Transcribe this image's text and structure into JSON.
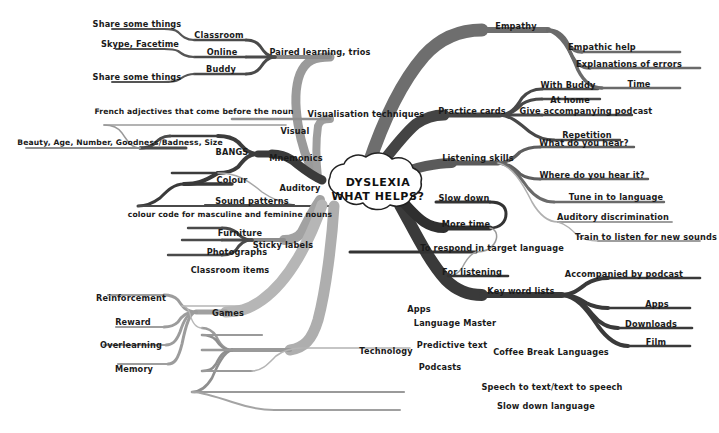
{
  "diagram": {
    "type": "mind-map",
    "title": "DYSLEXIA WHAT HELPS?",
    "center": {
      "line1": "DYSLEXIA",
      "line2": "WHAT HELPS?"
    },
    "palette": {
      "background": "#ffffff",
      "text": "#1a1a1a",
      "branch_dark": "#3a3a3a",
      "branch_mid": "#6e6e6e",
      "branch_light": "#a8a8a8",
      "branch_pale": "#c4c4c4"
    },
    "branches": [
      {
        "id": "paired-learning",
        "label": "Paired learning, trios",
        "children": [
          {
            "label": "Classroom",
            "children": [
              {
                "label": "Share some things"
              }
            ]
          },
          {
            "label": "Online",
            "children": [
              {
                "label": "Skype, Facetime"
              }
            ]
          },
          {
            "label": "Buddy",
            "children": [
              {
                "label": "Share some things"
              }
            ]
          }
        ]
      },
      {
        "id": "visualisation",
        "label": "Visualisation techniques",
        "children": []
      },
      {
        "id": "mnemonics",
        "label": "Mnemonics",
        "children": [
          {
            "label": "Visual",
            "children": [
              {
                "label": "BANGS",
                "children": [
                  {
                    "label": "French adjectives that come before the noun"
                  },
                  {
                    "label": "Beauty, Age, Number, Goodness/Badness, Size"
                  }
                ]
              }
            ]
          },
          {
            "label": "Auditory",
            "children": [
              {
                "label": "Colour",
                "children": [
                  {
                    "label": "colour code for masculine and feminine nouns"
                  }
                ]
              },
              {
                "label": "Sound patterns"
              }
            ]
          }
        ]
      },
      {
        "id": "sticky-labels",
        "label": "Sticky labels",
        "children": [
          {
            "label": "Furniture"
          },
          {
            "label": "Photographs"
          },
          {
            "label": "Classroom items"
          }
        ]
      },
      {
        "id": "games",
        "label": "Games",
        "children": [
          {
            "label": "Reinforcement"
          },
          {
            "label": "Reward"
          },
          {
            "label": "Overlearning"
          },
          {
            "label": "Memory"
          }
        ]
      },
      {
        "id": "technology",
        "label": "Technology",
        "children": [
          {
            "label": "Apps"
          },
          {
            "label": "Language Master"
          },
          {
            "label": "Predictive text"
          },
          {
            "label": "Podcasts",
            "children": [
              {
                "label": "Coffee Break Languages"
              }
            ]
          },
          {
            "label": "Speech to text/text to speech"
          },
          {
            "label": "Slow down language"
          }
        ]
      },
      {
        "id": "key-word-lists",
        "label": "Key word lists",
        "children": [
          {
            "label": "Accompanied by podcast"
          },
          {
            "label": "Apps"
          },
          {
            "label": "Downloads"
          },
          {
            "label": "Film"
          }
        ]
      },
      {
        "id": "more-time",
        "label": "More time",
        "children": [
          {
            "label": "Slow down"
          },
          {
            "label": "To respond in target language"
          },
          {
            "label": "For listening"
          }
        ]
      },
      {
        "id": "listening-skills",
        "label": "Listening skills",
        "children": [
          {
            "label": "What do you hear?"
          },
          {
            "label": "Where do you hear it?"
          },
          {
            "label": "Tune in to language"
          },
          {
            "label": "Auditory discrimination",
            "children": [
              {
                "label": "Train to listen for new sounds"
              }
            ]
          }
        ]
      },
      {
        "id": "practice-cards",
        "label": "Practice cards",
        "children": [
          {
            "label": "With Buddy"
          },
          {
            "label": "At home"
          },
          {
            "label": "Give accompanying podcast"
          },
          {
            "label": "Repetition"
          }
        ]
      },
      {
        "id": "empathy",
        "label": "Empathy",
        "children": [
          {
            "label": "Empathic help"
          },
          {
            "label": "Explanations of errors"
          },
          {
            "label": "Time"
          }
        ]
      }
    ],
    "labels": {
      "share_some_things_1": "Share some things",
      "skype_facetime": "Skype, Facetime",
      "share_some_things_2": "Share some things",
      "classroom": "Classroom",
      "online": "Online",
      "buddy": "Buddy",
      "paired_learning": "Paired learning, trios",
      "french_adjectives": "French adjectives that come before the noun",
      "bangs_expansion": "Beauty, Age, Number, Goodness/Badness, Size",
      "bangs": "BANGS",
      "visual": "Visual",
      "mnemonics": "Mnemonics",
      "auditory": "Auditory",
      "colour": "Colour",
      "sound_patterns": "Sound patterns",
      "colour_code": "colour code for masculine and feminine nouns",
      "visualisation": "Visualisation techniques",
      "furniture": "Furniture",
      "photographs": "Photographs",
      "classroom_items": "Classroom items",
      "sticky_labels": "Sticky labels",
      "reinforcement": "Reinforcement",
      "reward": "Reward",
      "overlearning": "Overlearning",
      "memory": "Memory",
      "games": "Games",
      "technology": "Technology",
      "apps_tech": "Apps",
      "language_master": "Language Master",
      "predictive_text": "Predictive text",
      "podcasts": "Podcasts",
      "coffee_break": "Coffee Break Languages",
      "speech_to_text": "Speech to text/text to speech",
      "slow_down_language": "Slow down language",
      "empathy": "Empathy",
      "empathic_help": "Empathic help",
      "explanations_errors": "Explanations of errors",
      "time": "Time",
      "practice_cards": "Practice cards",
      "with_buddy": "With Buddy",
      "at_home": "At home",
      "give_podcast": "Give accompanying podcast",
      "repetition": "Repetition",
      "listening_skills": "Listening skills",
      "what_do_you_hear": "What do you hear?",
      "where_do_you_hear": "Where do you hear it?",
      "tune_in": "Tune in to language",
      "auditory_discrimination": "Auditory discrimination",
      "train_to_listen": "Train to listen for new sounds",
      "slow_down": "Slow down",
      "more_time": "More time",
      "to_respond": "To respond in target language",
      "for_listening": "For listening",
      "key_word_lists": "Key word lists",
      "accompanied_podcast": "Accompanied by podcast",
      "apps_kwl": "Apps",
      "downloads": "Downloads",
      "film": "Film"
    }
  }
}
